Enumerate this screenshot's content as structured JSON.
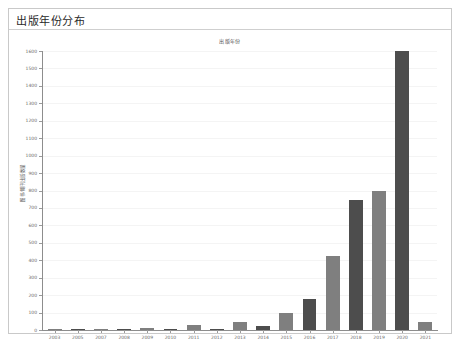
{
  "panel": {
    "title": "出版年份分布"
  },
  "chart_data": {
    "type": "bar",
    "title": "出版年份",
    "xlabel": "",
    "ylabel": "图书/期刊出版数量",
    "categories": [
      "2003",
      "2005",
      "2007",
      "2008",
      "2009",
      "2010",
      "2011",
      "2012",
      "2013",
      "2014",
      "2015",
      "2016",
      "2017",
      "2018",
      "2019",
      "2020",
      "2021"
    ],
    "values": [
      4,
      2,
      2,
      5,
      14,
      3,
      30,
      4,
      46,
      25,
      96,
      175,
      424,
      745,
      800,
      1600,
      48
    ],
    "ylim": [
      0,
      1600
    ],
    "yticks": [
      0,
      100,
      200,
      300,
      400,
      500,
      600,
      700,
      800,
      900,
      1000,
      1100,
      1200,
      1300,
      1400,
      1500,
      1600
    ],
    "ytick_labels": [
      "0",
      "100",
      "200",
      "300",
      "400",
      "500",
      "600",
      "700",
      "800",
      "900",
      "1000",
      "1100",
      "1200",
      "1300",
      "1400",
      "1500",
      "1600"
    ],
    "grid": false,
    "legend": "none",
    "bar_colors": [
      "#7f7f7f",
      "#4d4d4d"
    ],
    "axis_color": "#8d8d8d"
  }
}
